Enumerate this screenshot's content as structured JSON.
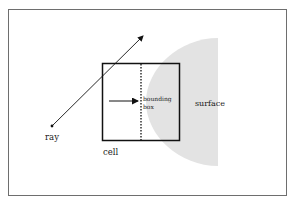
{
  "diagram": {
    "labels": {
      "ray": "ray",
      "cell": "cell",
      "bounding_box_line1": "bounding",
      "bounding_box_line2": "box",
      "surface": "surface"
    },
    "colors": {
      "frame": "#6e6e6e",
      "stroke": "#111111",
      "surface_fill": "#e3e3e3",
      "background": "#ffffff"
    }
  }
}
